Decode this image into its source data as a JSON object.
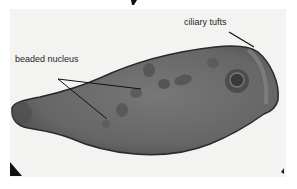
{
  "figure": {
    "labels": [
      {
        "id": "beaded-nucleus",
        "text": "beaded nucleus"
      },
      {
        "id": "ciliary-tufts",
        "text": "ciliary tufts"
      }
    ],
    "colors": {
      "background": "#f3f3f1",
      "cell_body": "#6e6e6e",
      "cell_outline": "#2a2a2a",
      "nucleus_bead": "#555555",
      "leader_line": "#111111"
    }
  }
}
